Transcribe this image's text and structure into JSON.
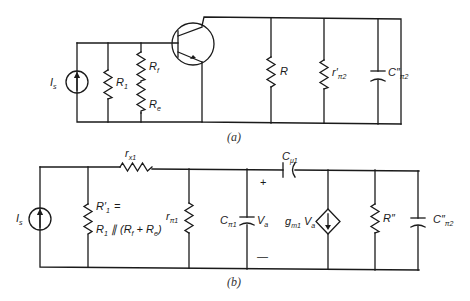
{
  "figure": {
    "type": "small-signal equivalent circuit diagram",
    "panels": [
      {
        "id": "a",
        "caption": "(a)",
        "labels": {
          "source": "I",
          "source_sub": "s",
          "r1": "R",
          "r1_sub": "1",
          "rf": "R",
          "rf_sub": "f",
          "re": "R",
          "re_sub": "e",
          "r": "R",
          "rpi2": "r′",
          "rpi2_sub": "π2",
          "cpi2": "C″",
          "cpi2_sub": "π2"
        },
        "components": [
          "current-source Is",
          "resistor R1",
          "resistor Rf",
          "resistor Re",
          "npn transistor",
          "resistor R",
          "resistor r'π2",
          "capacitor C''π2"
        ]
      },
      {
        "id": "b",
        "caption": "(b)",
        "labels": {
          "source": "I",
          "source_sub": "s",
          "r1p_line1": "R′",
          "r1p_line1_sub": "1",
          "r1p_eq": "=",
          "r1p_line2": "R",
          "r1p_line2_sub": "1",
          "r1p_line2_rest": " ∥ (R",
          "r1p_f": "f",
          "r1p_plus": " + R",
          "r1p_e": "e",
          "r1p_close": ")",
          "rx1": "r",
          "rx1_sub": "x1",
          "rpi1": "r",
          "rpi1_sub": "π1",
          "cpi1": "C",
          "cpi1_sub": "π1",
          "va": "V",
          "va_sub": "a",
          "plus": "+",
          "minus": "—",
          "cmu1": "C",
          "cmu1_sub": "μ1",
          "gm": "g",
          "gm_sub": "m1",
          "gm_va": " V",
          "gm_va_sub": "a",
          "rpp": "R″",
          "cpi2": "C″",
          "cpi2_sub": "π2"
        },
        "components": [
          "current-source Is",
          "resistor R'1",
          "resistor rx1",
          "resistor rπ1",
          "capacitor Cπ1",
          "capacitor Cμ1",
          "dependent-current-source gm1Va",
          "resistor R''",
          "capacitor C''π2"
        ]
      }
    ]
  }
}
